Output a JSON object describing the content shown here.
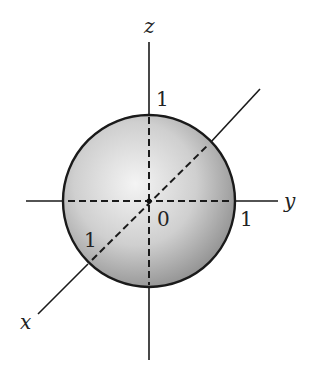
{
  "diagram": {
    "axes": {
      "x": {
        "label": "x",
        "tick": "1"
      },
      "y": {
        "label": "y",
        "tick": "1"
      },
      "z": {
        "label": "z",
        "tick": "1"
      }
    },
    "origin_label": "0",
    "colors": {
      "sphere_light": "#f4f4f4",
      "sphere_dark": "#8e8e8e",
      "stroke": "#1a1a1a"
    }
  }
}
